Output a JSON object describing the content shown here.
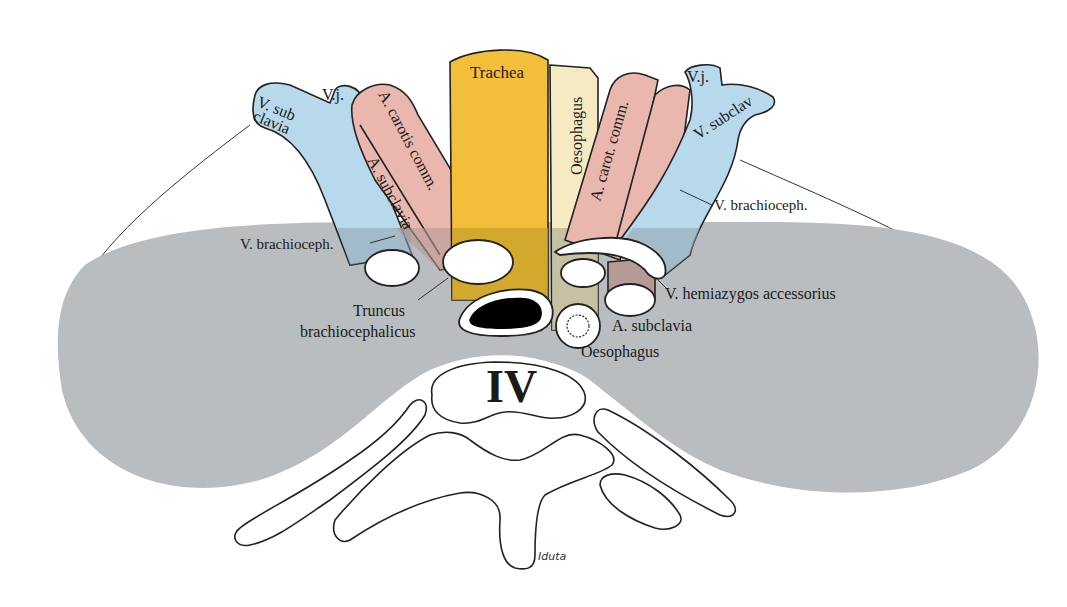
{
  "diagram": {
    "colors": {
      "background": "#ffffff",
      "pleura_gray": "#b9bdbf",
      "vein_blue": "#b8d8ec",
      "artery_pink": "#eab7ae",
      "artery_pink_shaded": "#b59a95",
      "trachea_yellow": "#f3bf3a",
      "trachea_shaded": "#c8a22a",
      "oesophagus_cream": "#f6eac2",
      "oesophagus_shaded": "#bdb59a",
      "vein_shaded": "#8ea4ae",
      "outline": "#222222",
      "lumen_black": "#000000"
    },
    "labels": {
      "trachea": "Trachea",
      "oesophagus_upper": "Oesophagus",
      "left_v_subclavia_1": "V. sub",
      "left_v_subclavia_2": "clavia",
      "left_vj": "V.j.",
      "left_a_carotis": "A. carotis comm.",
      "left_a_subclavia": "A. subclavia",
      "left_v_brachioceph": "V. brachioceph.",
      "right_a_carot": "A. carot. comm.",
      "right_vj": "V.j.",
      "right_v_subclav": "V. subclav",
      "right_v_brachioceph": "V. brachioceph.",
      "truncus_1": "Truncus",
      "truncus_2": "brachiocephalicus",
      "v_hemiazygos": "V. hemiazygos accessorius",
      "a_subclavia_lower": "A. subclavia",
      "oesophagus_lower": "Oesophagus",
      "vertebra": "IV",
      "signature": "Iduta"
    }
  }
}
